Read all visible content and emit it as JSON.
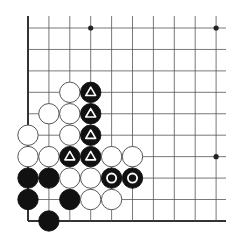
{
  "board": {
    "origin_x": 28,
    "origin_y": 28,
    "dx": 20.9,
    "dy": 21.44,
    "cols": 10,
    "rows": 10,
    "line_extend_right": 226,
    "line_color": "#555555",
    "border_color": "#333333",
    "edges": [
      "left",
      "bottom"
    ],
    "hoshi": [
      [
        3,
        0
      ],
      [
        9,
        0
      ],
      [
        9,
        6
      ]
    ]
  },
  "stones": [
    {
      "col": 2,
      "row": 3,
      "color": "white"
    },
    {
      "col": 3,
      "row": 3,
      "color": "black",
      "mark": "triangle"
    },
    {
      "col": 1,
      "row": 4,
      "color": "white"
    },
    {
      "col": 2,
      "row": 4,
      "color": "white"
    },
    {
      "col": 3,
      "row": 4,
      "color": "black",
      "mark": "triangle"
    },
    {
      "col": 0,
      "row": 5,
      "color": "white"
    },
    {
      "col": 2,
      "row": 5,
      "color": "white"
    },
    {
      "col": 3,
      "row": 5,
      "color": "black",
      "mark": "triangle"
    },
    {
      "col": 0,
      "row": 6,
      "color": "white"
    },
    {
      "col": 1,
      "row": 6,
      "color": "white"
    },
    {
      "col": 2,
      "row": 6,
      "color": "black",
      "mark": "triangle"
    },
    {
      "col": 3,
      "row": 6,
      "color": "black",
      "mark": "triangle"
    },
    {
      "col": 4,
      "row": 6,
      "color": "white"
    },
    {
      "col": 5,
      "row": 6,
      "color": "white"
    },
    {
      "col": 0,
      "row": 7,
      "color": "black"
    },
    {
      "col": 1,
      "row": 7,
      "color": "black"
    },
    {
      "col": 2,
      "row": 7,
      "color": "white"
    },
    {
      "col": 3,
      "row": 7,
      "color": "white"
    },
    {
      "col": 4,
      "row": 7,
      "color": "black",
      "mark": "circle"
    },
    {
      "col": 5,
      "row": 7,
      "color": "black",
      "mark": "circle"
    },
    {
      "col": 0,
      "row": 8,
      "color": "black"
    },
    {
      "col": 2,
      "row": 8,
      "color": "black"
    },
    {
      "col": 3,
      "row": 8,
      "color": "white"
    },
    {
      "col": 4,
      "row": 8,
      "color": "white"
    },
    {
      "col": 1,
      "row": 9,
      "color": "black"
    }
  ]
}
